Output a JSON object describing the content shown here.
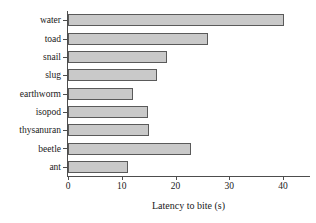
{
  "chart_data": {
    "type": "bar",
    "orientation": "horizontal",
    "title": "",
    "xlabel": "Latency to bite (s)",
    "ylabel": "",
    "categories": [
      "water",
      "toad",
      "snail",
      "slug",
      "earthworm",
      "isopod",
      "thysanuran",
      "beetle",
      "ant"
    ],
    "values": [
      40.2,
      26.0,
      18.4,
      16.5,
      12.1,
      14.9,
      15.1,
      22.8,
      11.2
    ],
    "xlim": [
      0,
      45
    ],
    "xticks": [
      0,
      10,
      20,
      30,
      40
    ],
    "xtick_labels": [
      "0",
      "10",
      "20",
      "30",
      "40"
    ],
    "grid": false,
    "legend": false,
    "bar_fill_color": "#c9c9c9",
    "bar_edge_color": "#5a5a5a",
    "axis_color": "#4d4d4d",
    "background_color": "#ffffff"
  }
}
